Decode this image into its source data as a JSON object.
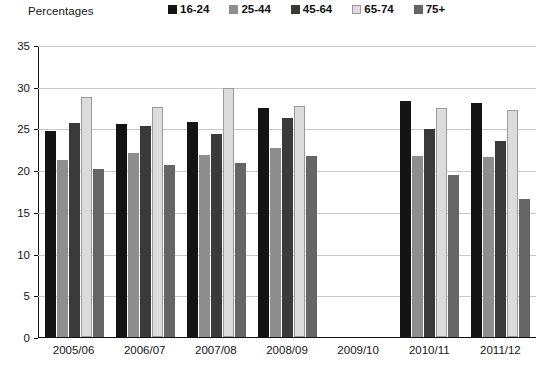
{
  "header": {
    "axis_title": "Percentages"
  },
  "legend": {
    "position": "top",
    "items": [
      {
        "label": "16-24",
        "color": "#141414"
      },
      {
        "label": "25-44",
        "color": "#8e8e8e"
      },
      {
        "label": "45-64",
        "color": "#3a3a3a"
      },
      {
        "label": "65-74",
        "color": "#dcdcdc"
      },
      {
        "label": "75+",
        "color": "#656565"
      }
    ]
  },
  "chart_data": {
    "type": "bar",
    "title": "",
    "subtitle": "",
    "xlabel": "",
    "ylabel": "Percentages",
    "ylim": [
      0,
      35
    ],
    "yticks": [
      0,
      5,
      10,
      15,
      20,
      25,
      30,
      35
    ],
    "grid": true,
    "legend_position": "top",
    "categories": [
      "2005/06",
      "2006/07",
      "2007/08",
      "2008/09",
      "2009/10",
      "2010/11",
      "2011/12"
    ],
    "series": [
      {
        "name": "16-24",
        "color": "#141414",
        "values": [
          24.7,
          25.5,
          25.8,
          27.5,
          null,
          28.3,
          28.1
        ]
      },
      {
        "name": "25-44",
        "color": "#8e8e8e",
        "values": [
          21.2,
          22.0,
          21.8,
          22.6,
          null,
          21.7,
          21.6
        ]
      },
      {
        "name": "45-64",
        "color": "#3a3a3a",
        "values": [
          25.7,
          25.3,
          24.3,
          26.3,
          null,
          24.9,
          23.5
        ]
      },
      {
        "name": "65-74",
        "color": "#dcdcdc",
        "values": [
          28.8,
          27.6,
          29.8,
          27.7,
          null,
          27.4,
          27.2
        ]
      },
      {
        "name": "75+",
        "color": "#656565",
        "values": [
          20.1,
          20.6,
          20.8,
          21.7,
          null,
          19.4,
          16.5
        ]
      }
    ]
  },
  "yticks_labels": [
    "0",
    "5",
    "10",
    "15",
    "20",
    "25",
    "30",
    "35"
  ]
}
